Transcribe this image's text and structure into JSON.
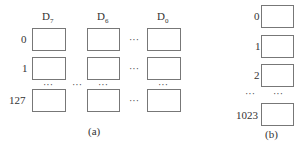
{
  "diagram_a": {
    "caption": "(a)",
    "columns": [
      {
        "name": "D",
        "sub": "7"
      },
      {
        "name": "D",
        "sub": "6"
      },
      {
        "name": "D",
        "sub": "0"
      }
    ],
    "row_labels": [
      "0",
      "1",
      "127"
    ],
    "ellipsis": "···"
  },
  "diagram_b": {
    "caption": "(b)",
    "row_labels": [
      "0",
      "1",
      "2",
      "1023"
    ],
    "ellipsis": "···"
  }
}
